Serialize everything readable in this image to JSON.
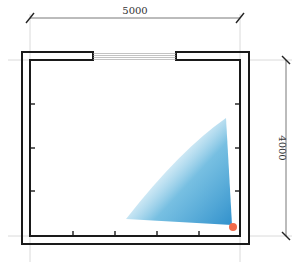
{
  "diagram": {
    "type": "floor-plan",
    "width_label": "5000",
    "height_label": "4000",
    "colors": {
      "wall": "#1a1a1a",
      "dimension_line": "#555555",
      "guide_line": "#cccccc",
      "coverage_fill": "#3a9ad0",
      "sensor_dot": "#f06a4a"
    },
    "features": {
      "window": "top wall opening",
      "sensor": "bottom-right corner",
      "coverage": "fan-shaped detection area toward upper-left"
    }
  }
}
